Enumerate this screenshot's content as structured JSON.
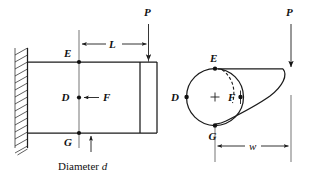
{
  "figure": {
    "background_color": "#ffffff",
    "ink_color": "#1b1b1b"
  },
  "side_view": {
    "name": "side-view",
    "load_label": "P",
    "length_label": "L",
    "force_label": "F",
    "point_top_label": "E",
    "point_mid_label": "D",
    "point_bottom_label": "G",
    "diameter_note": "Diameter d",
    "diameter_note_prefix": "Diameter",
    "diameter_note_symbol": "d"
  },
  "section_view": {
    "name": "section-view",
    "load_label": "P",
    "width_label": "w",
    "force_label": "F",
    "point_top_label": "E",
    "point_left_label": "D",
    "point_bottom_label": "G",
    "center_mark": "+"
  }
}
